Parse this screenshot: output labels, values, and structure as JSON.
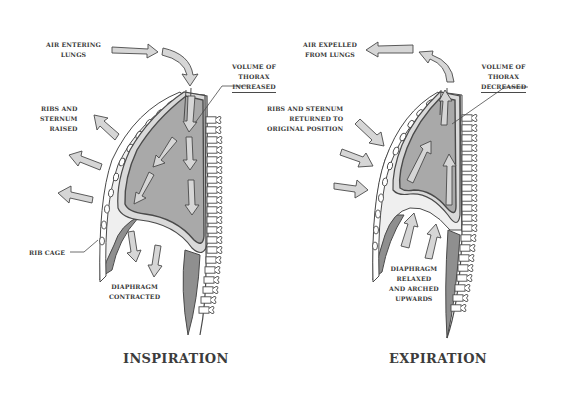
{
  "diagram": {
    "type": "anatomical-illustration",
    "colors": {
      "background": "#ffffff",
      "lung_fill": "#a9a9a9",
      "pleura": "#e3e3e3",
      "outline": "#4a4a4a",
      "arrow_fill": "#d6d6d6",
      "text": "#3a3a3a"
    }
  },
  "inspiration": {
    "title": "INSPIRATION",
    "labels": {
      "air": [
        "AIR ENTERING",
        "LUNGS"
      ],
      "volume": [
        "VOLUME OF",
        "THORAX",
        "INCREASED"
      ],
      "ribs": [
        "RIBS AND",
        "STERNUM",
        "RAISED"
      ],
      "ribcage": "RIB CAGE",
      "diaphragm": [
        "DIAPHRAGM",
        "CONTRACTED"
      ]
    }
  },
  "expiration": {
    "title": "EXPIRATION",
    "labels": {
      "air": [
        "AIR EXPELLED",
        "FROM LUNGS"
      ],
      "volume": [
        "VOLUME OF",
        "THORAX",
        "DECREASED"
      ],
      "ribs": [
        "RIBS AND STERNUM",
        "RETURNED TO",
        "ORIGINAL POSITION"
      ],
      "diaphragm": [
        "DIAPHRAGM",
        "RELAXED",
        "AND ARCHED",
        "UPWARDS"
      ]
    }
  }
}
